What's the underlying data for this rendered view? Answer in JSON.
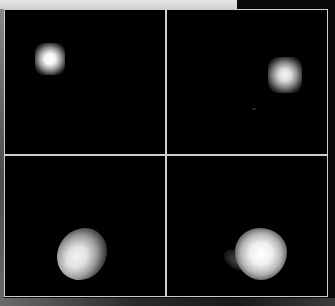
{
  "figure": {
    "layout": "2x2 grid",
    "background_color": "#000000",
    "grid_line_color": "#cfcfcf",
    "panels": [
      {
        "position": "top-left",
        "content": "small bright square point source",
        "center": [
          49,
          59
        ]
      },
      {
        "position": "top-right",
        "content": "small bright square point source",
        "center": [
          283,
          75
        ]
      },
      {
        "position": "bottom-left",
        "content": "diffuse tilted elliptical blob",
        "center": [
          82,
          251
        ]
      },
      {
        "position": "bottom-right",
        "content": "diffuse larger blob with faint tail to the left",
        "center": [
          255,
          254
        ]
      }
    ]
  }
}
